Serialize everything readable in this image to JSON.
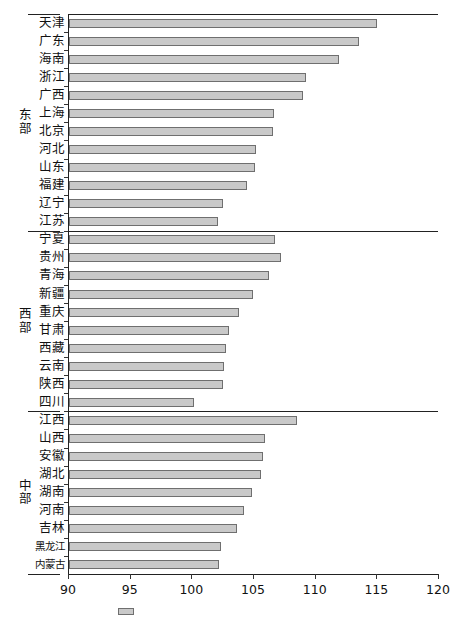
{
  "chart_data": {
    "type": "bar",
    "orientation": "horizontal",
    "title": "",
    "xlabel": "",
    "ylabel": "",
    "xlim": [
      90,
      120
    ],
    "xticks": [
      90,
      95,
      100,
      105,
      110,
      115,
      120
    ],
    "xtick_labels": [
      "90",
      "95",
      "100",
      "105",
      "110",
      "115",
      "120"
    ],
    "grid": false,
    "legend_position": "bottom",
    "legend_entries": [
      ""
    ],
    "bar_color": "#c9c9c9",
    "bar_edge_color": "#6f6f6f",
    "groups": [
      {
        "name": "东部",
        "name_chars": [
          "东",
          "部"
        ],
        "categories": [
          "天津",
          "广东",
          "海南",
          "浙江",
          "广西",
          "上海",
          "北京",
          "河北",
          "山东",
          "福建",
          "辽宁",
          "江苏"
        ],
        "values": [
          115.0,
          113.5,
          111.9,
          109.2,
          109.0,
          106.6,
          106.5,
          105.2,
          105.1,
          104.4,
          102.5,
          102.1
        ]
      },
      {
        "name": "西部",
        "name_chars": [
          "西",
          "部"
        ],
        "categories": [
          "宁夏",
          "贵州",
          "青海",
          "新疆",
          "重庆",
          "甘肃",
          "西藏",
          "云南",
          "陕西",
          "四川"
        ],
        "values": [
          106.7,
          107.2,
          106.2,
          104.9,
          103.8,
          103.0,
          102.7,
          102.6,
          102.5,
          100.1
        ]
      },
      {
        "name": "中部",
        "name_chars": [
          "中",
          "部"
        ],
        "categories": [
          "江西",
          "山西",
          "安徽",
          "湖北",
          "湖南",
          "河南",
          "吉林",
          "黑龙江",
          "内蒙古"
        ],
        "values": [
          108.5,
          105.9,
          105.7,
          105.6,
          104.8,
          104.2,
          103.6,
          102.3,
          102.2
        ]
      }
    ]
  }
}
